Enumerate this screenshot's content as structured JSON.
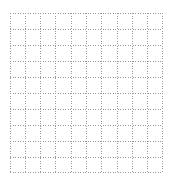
{
  "grid": {
    "rows": 10,
    "columns": 10,
    "line_style": "dotted",
    "line_color": "#9a9a9a",
    "background_color": "#ffffff",
    "x_lines": [
      0,
      15.3,
      30.6,
      45.9,
      61.2,
      76.5,
      91.8,
      107.1,
      122.4,
      137.7,
      153
    ],
    "y_lines": [
      0,
      16,
      32,
      48,
      64,
      80,
      96,
      112,
      128,
      144,
      160
    ]
  }
}
